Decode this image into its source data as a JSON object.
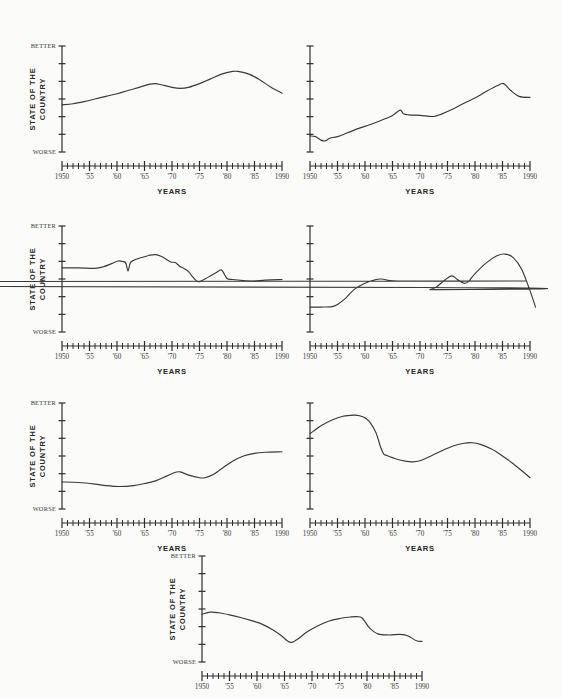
{
  "page": {
    "background_color": "#fbfbf9",
    "ink_color": "#2e2e2e",
    "figure_kind": "small-multiples of seven line charts"
  },
  "labels": {
    "xaxis_title": "YEARS",
    "yaxis_title_line1": "STATE OF THE",
    "yaxis_title_line2": "COUNTRY",
    "y_top": "BETTER",
    "y_bottom": "WORSE",
    "x_ticks": [
      "1950",
      "'55",
      "'60",
      "'65",
      "'70",
      "'75",
      "'80",
      "'85",
      "1990"
    ],
    "x_tick_values": [
      1950,
      1955,
      1960,
      1965,
      1970,
      1975,
      1980,
      1985,
      1990
    ]
  },
  "chart_data": [
    {
      "id": "chart-1",
      "position": "top-left",
      "type": "line",
      "title": "",
      "xlabel": "YEARS",
      "ylabel": "STATE OF THE COUNTRY",
      "xlim": [
        1950,
        1990
      ],
      "ylim": [
        0,
        10
      ],
      "y_top_label": "BETTER",
      "y_bottom_label": "WORSE",
      "y_axis_labeled": true,
      "grid": false,
      "legend": "none",
      "x": [
        1950,
        1952,
        1954,
        1956,
        1958,
        1960,
        1962,
        1964,
        1966,
        1967,
        1968,
        1970,
        1971.5,
        1973,
        1975,
        1977,
        1979,
        1981,
        1982,
        1984,
        1986,
        1988,
        1990
      ],
      "values": [
        4.45,
        4.55,
        4.75,
        5.0,
        5.25,
        5.5,
        5.8,
        6.1,
        6.4,
        6.45,
        6.35,
        6.1,
        6.0,
        6.1,
        6.45,
        6.9,
        7.35,
        7.6,
        7.6,
        7.35,
        6.8,
        6.1,
        5.55
      ]
    },
    {
      "id": "chart-2",
      "position": "top-right",
      "type": "line",
      "title": "",
      "xlabel": "YEARS",
      "ylabel": "",
      "xlim": [
        1950,
        1990
      ],
      "ylim": [
        0,
        10
      ],
      "y_axis_labeled": false,
      "grid": false,
      "legend": "none",
      "x": [
        1950,
        1951,
        1952,
        1952.8,
        1953.6,
        1955,
        1957,
        1959,
        1961,
        1963,
        1965,
        1966.4,
        1967,
        1968,
        1970,
        1972.5,
        1974,
        1976,
        1978,
        1980,
        1982,
        1984,
        1985.2,
        1986.5,
        1988,
        1990
      ],
      "values": [
        1.52,
        1.45,
        1.12,
        1.05,
        1.3,
        1.45,
        1.85,
        2.25,
        2.6,
        3.0,
        3.45,
        3.95,
        3.6,
        3.5,
        3.45,
        3.35,
        3.6,
        4.05,
        4.6,
        5.1,
        5.7,
        6.25,
        6.45,
        5.8,
        5.25,
        5.15
      ]
    },
    {
      "id": "chart-3",
      "position": "middle-left",
      "type": "line",
      "title": "",
      "xlabel": "YEARS",
      "ylabel": "STATE OF THE COUNTRY",
      "xlim": [
        1950,
        1990
      ],
      "ylim": [
        0,
        10
      ],
      "y_top_label": "BETTER",
      "y_bottom_label": "WORSE",
      "y_axis_labeled": true,
      "grid": false,
      "legend": "none",
      "x": [
        1950,
        1953,
        1956,
        1957.5,
        1959,
        1960.2,
        1961,
        1961.6,
        1962.0,
        1962.4,
        1963,
        1964,
        1965,
        1966,
        1967,
        1968,
        1969,
        1969.8,
        1970.6,
        1971.4,
        1972,
        1973,
        1973.6,
        1974.4,
        1975,
        1976,
        1977,
        1978,
        1978.8,
        1979.2,
        1980,
        1981,
        1983,
        1985,
        1987,
        1990
      ],
      "values": [
        6.05,
        6.05,
        6.0,
        6.15,
        6.45,
        6.7,
        6.65,
        6.5,
        5.75,
        6.5,
        6.75,
        6.95,
        7.1,
        7.25,
        7.3,
        7.15,
        6.85,
        6.6,
        6.55,
        6.2,
        6.05,
        5.7,
        5.3,
        4.85,
        4.75,
        5.0,
        5.3,
        5.6,
        5.85,
        5.75,
        5.05,
        4.95,
        4.85,
        4.8,
        4.9,
        4.95
      ]
    },
    {
      "id": "chart-4",
      "position": "middle-right",
      "type": "line",
      "title": "",
      "xlabel": "YEARS",
      "ylabel": "",
      "xlim": [
        1950,
        1990
      ],
      "ylim": [
        0,
        10
      ],
      "y_axis_labeled": false,
      "grid": false,
      "legend": "none",
      "x": [
        1950,
        1952,
        1954,
        1955,
        1956.5,
        1958,
        1960,
        1962,
        1963,
        1964.5,
        1966,
        1967.5,
        1669,
        1970.5,
        1971.8,
        1973,
        1974.5,
        1975.8,
        1976.8,
        1978,
        1978.8,
        1980,
        1982,
        1984,
        1985.5,
        1987,
        1988.5,
        1990,
        1991
      ],
      "values": [
        2.35,
        2.35,
        2.4,
        2.6,
        3.2,
        4.0,
        4.6,
        4.95,
        5.0,
        4.85,
        4.8,
        4.8,
        4.6,
        4.2,
        4.0,
        4.25,
        4.9,
        5.3,
        4.95,
        4.6,
        4.75,
        5.5,
        6.5,
        7.2,
        7.35,
        7.0,
        5.9,
        3.9,
        2.35
      ]
    },
    {
      "id": "chart-5",
      "position": "bottom-left",
      "type": "line",
      "title": "",
      "xlabel": "YEARS",
      "ylabel": "STATE OF THE COUNTRY",
      "xlim": [
        1950,
        1990
      ],
      "ylim": [
        0,
        10
      ],
      "y_top_label": "BETTER",
      "y_bottom_label": "WORSE",
      "y_axis_labeled": true,
      "grid": false,
      "legend": "none",
      "x": [
        1950,
        1953,
        1956,
        1958,
        1960.5,
        1963,
        1965,
        1967,
        1969,
        1970.5,
        1971.5,
        1973,
        1975,
        1976,
        1977.5,
        1979,
        1981,
        1983,
        1985,
        1987,
        1990
      ],
      "values": [
        2.55,
        2.5,
        2.35,
        2.2,
        2.12,
        2.2,
        2.4,
        2.65,
        3.1,
        3.45,
        3.5,
        3.2,
        2.95,
        2.95,
        3.25,
        3.8,
        4.5,
        5.0,
        5.25,
        5.35,
        5.4
      ]
    },
    {
      "id": "chart-6",
      "position": "bottom-right",
      "type": "line",
      "title": "",
      "xlabel": "YEARS",
      "ylabel": "",
      "xlim": [
        1950,
        1990
      ],
      "ylim": [
        0,
        10
      ],
      "y_axis_labeled": false,
      "grid": false,
      "legend": "none",
      "x": [
        1950,
        1952,
        1954,
        1956,
        1958,
        1959,
        1960,
        1961,
        1962,
        1962.8,
        1963.4,
        1964,
        1965,
        1966.5,
        1968.5,
        1970,
        1972,
        1974,
        1976,
        1978,
        1979.5,
        1981,
        1983,
        1985,
        1987,
        1989,
        1990
      ],
      "values": [
        7.1,
        7.85,
        8.4,
        8.75,
        8.85,
        8.8,
        8.6,
        8.1,
        7.2,
        5.9,
        5.2,
        5.05,
        4.85,
        4.6,
        4.45,
        4.55,
        5.0,
        5.5,
        5.95,
        6.2,
        6.25,
        6.1,
        5.65,
        5.0,
        4.25,
        3.4,
        2.95
      ]
    },
    {
      "id": "chart-7",
      "position": "bottom-center",
      "type": "line",
      "title": "",
      "xlabel": "YEARS",
      "ylabel": "STATE OF THE COUNTRY",
      "xlim": [
        1950,
        1990
      ],
      "ylim": [
        0,
        10
      ],
      "y_top_label": "BETTER",
      "y_bottom_label": "WORSE",
      "y_axis_labeled": true,
      "grid": false,
      "legend": "none",
      "x": [
        1950,
        1951.5,
        1953,
        1955,
        1957,
        1959,
        1961,
        1963,
        1964.5,
        1965.5,
        1966.3,
        1967.5,
        1969,
        1971,
        1973,
        1975,
        1977,
        1978.8,
        1979.5,
        1980.5,
        1982,
        1984,
        1986,
        1987.5,
        1989,
        1990
      ],
      "values": [
        4.5,
        4.7,
        4.65,
        4.45,
        4.2,
        3.9,
        3.55,
        3.0,
        2.45,
        2.0,
        1.85,
        2.2,
        2.8,
        3.4,
        3.85,
        4.1,
        4.25,
        4.25,
        3.9,
        3.2,
        2.65,
        2.55,
        2.6,
        2.45,
        2.0,
        1.95
      ]
    }
  ]
}
